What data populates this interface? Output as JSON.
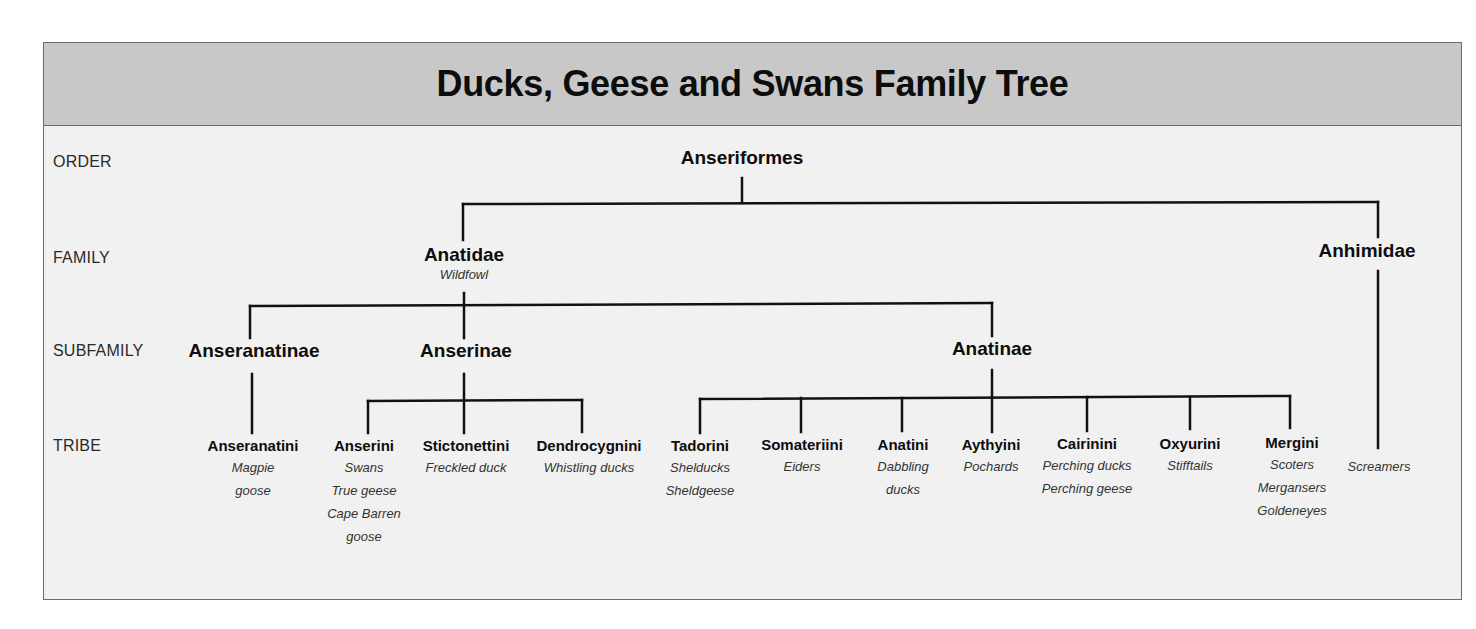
{
  "title": "Ducks, Geese and Swans Family Tree",
  "ranks": {
    "order": "ORDER",
    "family": "FAMILY",
    "subfamily": "SUBFAMILY",
    "tribe": "TRIBE"
  },
  "order": {
    "name": "Anseriformes"
  },
  "families": [
    {
      "name": "Anatidae",
      "common": "Wildfowl"
    },
    {
      "name": "Anhimidae",
      "common": ""
    }
  ],
  "subfamilies": [
    {
      "name": "Anseranatinae"
    },
    {
      "name": "Anserinae"
    },
    {
      "name": "Anatinae"
    }
  ],
  "tribes": [
    {
      "name": "Anseranatini",
      "common": [
        "Magpie",
        "goose"
      ]
    },
    {
      "name": "Anserini",
      "common": [
        "Swans",
        "True geese",
        "Cape Barren",
        "goose"
      ]
    },
    {
      "name": "Stictonettini",
      "common": [
        "Freckled duck"
      ]
    },
    {
      "name": "Dendrocygnini",
      "common": [
        "Whistling ducks"
      ]
    },
    {
      "name": "Tadorini",
      "common": [
        "Shelducks",
        "Sheldgeese"
      ]
    },
    {
      "name": "Somateriini",
      "common": [
        "Eiders"
      ]
    },
    {
      "name": "Anatini",
      "common": [
        "Dabbling",
        "ducks"
      ]
    },
    {
      "name": "Aythyini",
      "common": [
        "Pochards"
      ]
    },
    {
      "name": "Cairinini",
      "common": [
        "Perching ducks",
        "Perching geese"
      ]
    },
    {
      "name": "Oxyurini",
      "common": [
        "Stifftails"
      ]
    },
    {
      "name": "Mergini",
      "common": [
        "Scoters",
        "Mergansers",
        "Goldeneyes"
      ]
    },
    {
      "name": "",
      "common": [
        "Screamers"
      ]
    }
  ],
  "colors": {
    "header_bg": "#c8c8c8",
    "body_bg": "#f1f1f1",
    "line": "#111111"
  }
}
